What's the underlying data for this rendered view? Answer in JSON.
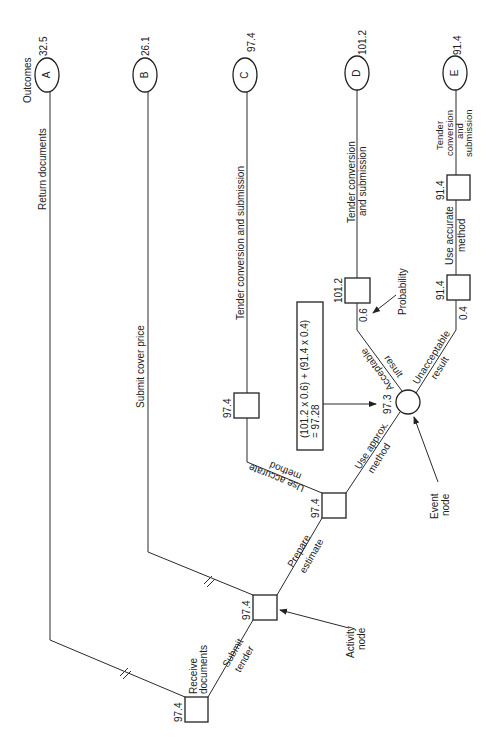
{
  "diagram": {
    "type": "decision-tree",
    "orientation": "rotated-90-ccw",
    "outcomes_label": "Outcomes",
    "outcomes": [
      {
        "id": "A",
        "value": "32.5",
        "branch_label": "Return documents"
      },
      {
        "id": "B",
        "value": "26.1",
        "branch_label": "Submit cover price"
      },
      {
        "id": "C",
        "value": "97.4",
        "branch_label": "Tender conversion and submission"
      },
      {
        "id": "D",
        "value": "101.2",
        "branch_label_line1": "Tender conversion",
        "branch_label_line2": "and submission"
      },
      {
        "id": "E",
        "value": "91.4",
        "branch_label_line1": "Tender",
        "branch_label_line2": "conversion",
        "branch_label_line3": "and",
        "branch_label_line4": "submission"
      }
    ],
    "activity_nodes": {
      "receive": {
        "value": "97.4",
        "label_line1": "Receive",
        "label_line2": "documents"
      },
      "submit": {
        "value": "97.4"
      },
      "prepare": {
        "value": "97.4"
      },
      "accurate_c": {
        "value": "97.4"
      },
      "d_box": {
        "value": "101.2"
      },
      "e_lower": {
        "value": "91.4"
      },
      "e_upper": {
        "value": "91.4"
      }
    },
    "event_node": {
      "value": "97.3"
    },
    "branch_labels": {
      "submit_tender_1": "Submit",
      "submit_tender_2": "tender",
      "prepare_estimate_1": "Prepare",
      "prepare_estimate_2": "estimate",
      "use_accurate_1": "Use accurate",
      "use_accurate_2": "method",
      "use_approx_1": "Use approx.",
      "use_approx_2": "method",
      "acceptable_1": "Acceptable",
      "acceptable_2": "result",
      "unacceptable_1": "Unacceptable",
      "unacceptable_2": "result",
      "use_accurate_e_1": "Use accurate",
      "use_accurate_e_2": "method"
    },
    "probabilities": {
      "acceptable": "0.6",
      "unacceptable": "0.4"
    },
    "formula": {
      "line1": "(101.2 x 0.6) + (91.4 x 0.4)",
      "line2": "= 97.28"
    },
    "annotations": {
      "probability": "Probability",
      "activity_1": "Activity",
      "activity_2": "node",
      "event_1": "Event",
      "event_2": "node"
    }
  }
}
